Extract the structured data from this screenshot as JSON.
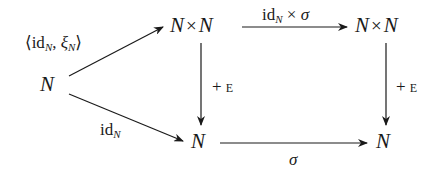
{
  "diagram": {
    "type": "commutative-diagram",
    "nodes": {
      "left": {
        "base": "N"
      },
      "top_middle": {
        "a": "N",
        "op": "×",
        "b": "N"
      },
      "top_right": {
        "a": "N",
        "op": "×",
        "b": "N"
      },
      "bottom_middle": {
        "base": "N"
      },
      "bottom_right": {
        "base": "N"
      }
    },
    "arrows": {
      "left_to_top_middle": {
        "open": "⟨",
        "id": "id",
        "id_sub": "N",
        "comma": ",",
        "xi": "ξ",
        "xi_sub": "N",
        "close": "⟩"
      },
      "left_to_bottom_middle": {
        "id": "id",
        "id_sub": "N"
      },
      "top_middle_to_top_right": {
        "id": "id",
        "id_sub": "N",
        "op": "×",
        "sigma": "σ"
      },
      "top_middle_to_bottom_middle": {
        "plus": "+",
        "e": "E"
      },
      "top_right_to_bottom_right": {
        "plus": "+",
        "e": "E"
      },
      "bottom_middle_to_bottom_right": {
        "sigma": "σ"
      }
    },
    "colors": {
      "ink": "#1a1a1a",
      "background": "#ffffff"
    }
  }
}
